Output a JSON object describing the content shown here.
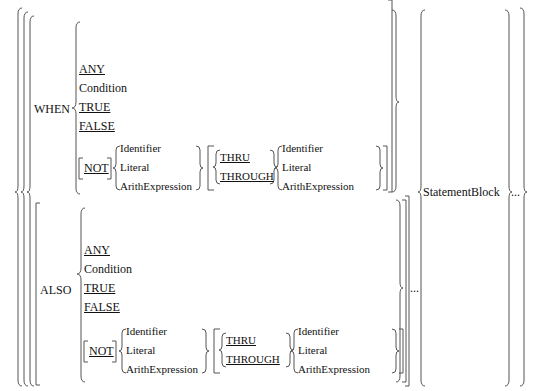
{
  "diagram": {
    "type": "syntax-diagram",
    "when_clause": {
      "keyword": "WHEN",
      "options": [
        "ANY",
        "Condition",
        "TRUE",
        "FALSE"
      ],
      "not_label": "NOT",
      "operands": [
        "Identifier",
        "Literal",
        "ArithExpression"
      ],
      "range_keywords": [
        "THRU",
        "THROUGH"
      ],
      "range_operands": [
        "Identifier",
        "Literal",
        "ArithExpression"
      ]
    },
    "also_clause": {
      "keyword": "ALSO",
      "options": [
        "ANY",
        "Condition",
        "TRUE",
        "FALSE"
      ],
      "not_label": "NOT",
      "operands": [
        "Identifier",
        "Literal",
        "ArithExpression"
      ],
      "range_keywords": [
        "THRU",
        "THROUGH"
      ],
      "range_operands": [
        "Identifier",
        "Literal",
        "ArithExpression"
      ],
      "repeat": "..."
    },
    "statement_block": "StatementBlock",
    "repeat": "..."
  }
}
